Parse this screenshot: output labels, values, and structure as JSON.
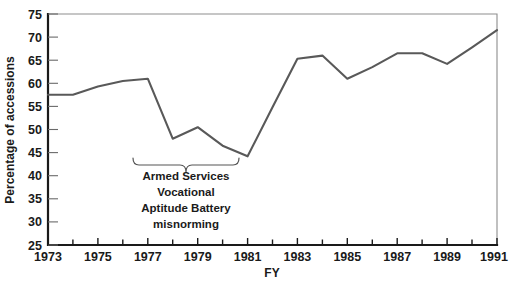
{
  "chart_data": {
    "type": "line",
    "title": "",
    "xlabel": "FY",
    "ylabel": "Percentage of accessions",
    "xlim": [
      1973,
      1991
    ],
    "ylim": [
      25,
      75
    ],
    "grid": false,
    "legend": null,
    "x": [
      1973,
      1974,
      1975,
      1976,
      1977,
      1978,
      1979,
      1980,
      1981,
      1982,
      1983,
      1984,
      1985,
      1986,
      1987,
      1988,
      1989,
      1990,
      1991
    ],
    "values": [
      57.5,
      57.5,
      59.3,
      60.5,
      61.0,
      48.0,
      50.5,
      46.5,
      44.2,
      54.8,
      65.3,
      66.0,
      61.0,
      63.5,
      66.5,
      66.5,
      64.2,
      67.8,
      71.5
    ],
    "series": [
      {
        "name": "Percentage of accessions",
        "color": "#595959",
        "values": [
          57.5,
          57.5,
          59.3,
          60.5,
          61.0,
          48.0,
          50.5,
          46.5,
          44.2,
          54.8,
          65.3,
          66.0,
          61.0,
          63.5,
          66.5,
          66.5,
          64.2,
          67.8,
          71.5
        ]
      }
    ],
    "ytick_labels": [
      "25",
      "30",
      "35",
      "40",
      "45",
      "50",
      "55",
      "60",
      "65",
      "70",
      "75"
    ],
    "ytick_values": [
      25,
      30,
      35,
      40,
      45,
      50,
      55,
      60,
      65,
      70,
      75
    ],
    "xtick_labels": [
      "1973",
      "1975",
      "1977",
      "1979",
      "1981",
      "1983",
      "1985",
      "1987",
      "1989",
      "1991"
    ],
    "xtick_values": [
      1973,
      1975,
      1977,
      1979,
      1981,
      1983,
      1985,
      1987,
      1989,
      1991
    ],
    "annotations": [
      {
        "name": "asvab-misnorming-bracket",
        "lines": [
          "Armed Services",
          "Vocational",
          "Aptitude Battery",
          "misnorming"
        ],
        "x_start": 1977,
        "x_end": 1980.8
      }
    ]
  }
}
